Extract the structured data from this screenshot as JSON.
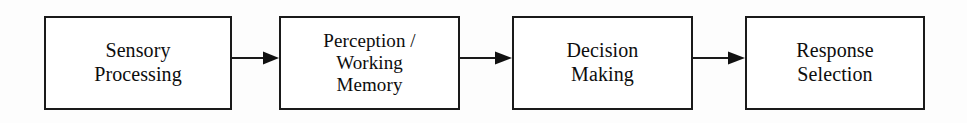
{
  "diagram": {
    "type": "flowchart",
    "orientation": "horizontal",
    "background_color": "#fdfdfd",
    "stroke_color": "#1a1a1a",
    "text_color": "#0d0d0d",
    "nodes": [
      {
        "id": "sensory-processing",
        "name": "Sensory Processing",
        "lines": [
          "Sensory",
          "Processing"
        ],
        "x": 44,
        "y": 16,
        "width": 188,
        "height": 94
      },
      {
        "id": "perception-working-memory",
        "name": "Perception / Working Memory",
        "lines": [
          "Perception /",
          "Working",
          "Memory"
        ],
        "x": 279,
        "y": 16,
        "width": 181,
        "height": 94
      },
      {
        "id": "decision-making",
        "name": "Decision Making",
        "lines": [
          "Decision",
          "Making"
        ],
        "x": 512,
        "y": 16,
        "width": 181,
        "height": 94
      },
      {
        "id": "response-selection",
        "name": "Response Selection",
        "lines": [
          "Response",
          "Selection"
        ],
        "x": 745,
        "y": 16,
        "width": 180,
        "height": 94
      }
    ],
    "connectors": [
      {
        "id": "arrow-1",
        "from": "sensory-processing",
        "to": "perception-working-memory",
        "x": 232,
        "y": 51,
        "width": 48
      },
      {
        "id": "arrow-2",
        "from": "perception-working-memory",
        "to": "decision-making",
        "x": 460,
        "y": 51,
        "width": 53
      },
      {
        "id": "arrow-3",
        "from": "decision-making",
        "to": "response-selection",
        "x": 693,
        "y": 51,
        "width": 53
      }
    ]
  }
}
